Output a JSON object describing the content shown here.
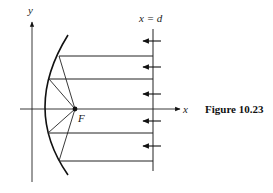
{
  "figure": {
    "caption": "Figure 10.23",
    "axis_labels": {
      "x": "x",
      "y": "y"
    },
    "line_label": "x = d",
    "focus_label": "F"
  },
  "geometry": {
    "y_axis": {
      "x": 32,
      "y_top": 20,
      "y_bottom": 182
    },
    "x_axis": {
      "y": 109,
      "x_left": 20,
      "x_right": 182
    },
    "focus": {
      "x": 75,
      "y": 109
    },
    "directrix_line": {
      "x": 153,
      "y_top": 29,
      "y_bottom": 171
    },
    "parabola": {
      "vertex_x": 45,
      "top": [
        68,
        35
      ],
      "bottom": [
        68,
        175
      ]
    },
    "rays": [
      {
        "y": 56,
        "hit_x": 59
      },
      {
        "y": 79,
        "hit_x": 49
      },
      {
        "y": 133,
        "hit_x": 48
      },
      {
        "y": 161,
        "hit_x": 59
      }
    ],
    "arrows_y": [
      41,
      67,
      94,
      121,
      146
    ]
  },
  "colors": {
    "stroke": "#111111",
    "background": "#ffffff"
  }
}
